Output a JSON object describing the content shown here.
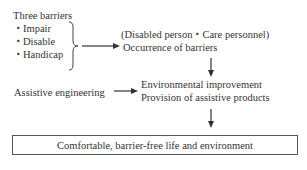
{
  "barriers": {
    "title": "Three barriers",
    "items": [
      "・Impair",
      "・Disable",
      "・Handicap"
    ]
  },
  "occurrence": {
    "line1": "(Disabled person・Care personnel)",
    "line2": "Occurrence of barriers"
  },
  "assistive": {
    "label": "Assistive engineering"
  },
  "improvement": {
    "line1": "Environmental improvement",
    "line2": "Provision of assistive products"
  },
  "result": {
    "label": "Comfortable, barrier-free life and environment"
  }
}
